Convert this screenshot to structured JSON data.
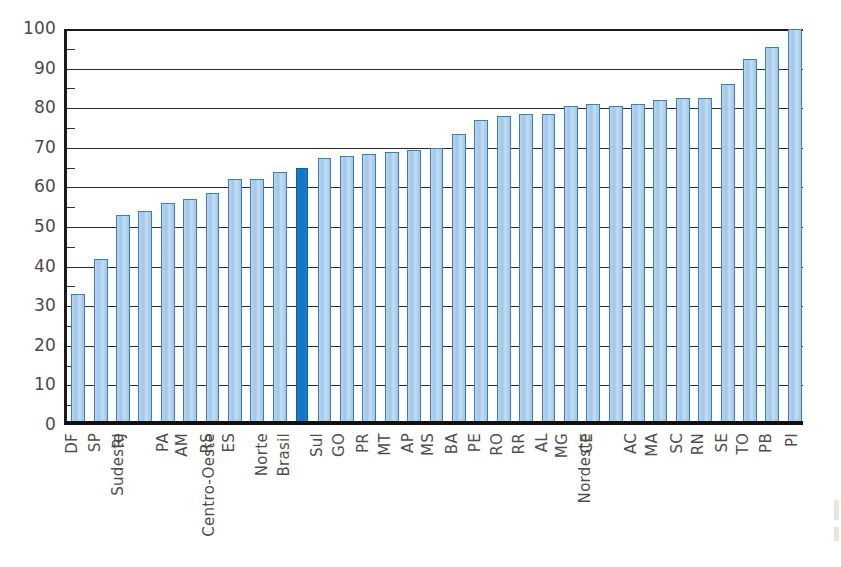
{
  "chart_data": {
    "type": "bar",
    "title": "",
    "subtitle": "",
    "xlabel": "",
    "ylabel": "",
    "ylim": [
      0,
      100
    ],
    "ytick_labels": [
      "100",
      "90",
      "80",
      "70",
      "60",
      "50",
      "40",
      "30",
      "20",
      "10",
      "0"
    ],
    "yticks": [
      100,
      90,
      80,
      70,
      60,
      50,
      40,
      30,
      20,
      10,
      0
    ],
    "grid": true,
    "legend": "none",
    "highlight_category": "Brasil",
    "colors": {
      "bar_fill": "#a8cdec",
      "bar_border": "#3b7fbf",
      "highlight_fill": "#1378c8",
      "highlight_border": "#0b5f9f",
      "axis": "#1a1a1a",
      "gridline": "#2b2b2b",
      "tick_text": "#4a4a4a"
    },
    "categories": [
      "DF",
      "SP",
      "RJ",
      "Sudeste",
      "PA",
      "AM",
      "RS",
      "ES",
      "Centro-Oeste",
      "Norte",
      "Brasil",
      "Sul",
      "GO",
      "PR",
      "MT",
      "AP",
      "MS",
      "BA",
      "PE",
      "RO",
      "RR",
      "AL",
      "MG",
      "CE",
      "Nordeste",
      "AC",
      "MA",
      "SC",
      "RN",
      "SE",
      "TO",
      "PB",
      "PI"
    ],
    "values": [
      32,
      41,
      52,
      53,
      55,
      56,
      57.5,
      61,
      61,
      63,
      64,
      66.5,
      67,
      67.5,
      68,
      68.5,
      69,
      72.5,
      76,
      77,
      77.5,
      77.5,
      79.5,
      80,
      79.5,
      80,
      81,
      81.5,
      81.5,
      85,
      91.5,
      94.5,
      99
    ]
  }
}
